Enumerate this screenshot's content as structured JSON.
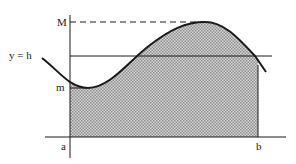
{
  "diagram": {
    "labels": {
      "max": "M",
      "min": "m",
      "line": "y = h",
      "a": "a",
      "b": "b"
    },
    "colors": {
      "stroke": "#1a1a1a",
      "fill": "#bdbdbd",
      "background": "#ffffff"
    }
  }
}
